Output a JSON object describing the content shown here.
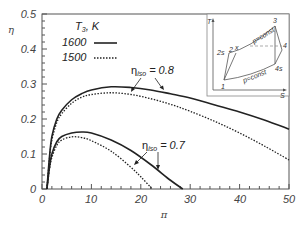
{
  "chart_data": {
    "type": "line",
    "title": "",
    "xlabel": "π",
    "ylabel": "η",
    "xlim": [
      0,
      50
    ],
    "ylim": [
      0,
      0.5
    ],
    "x_ticks": [
      "0",
      "10",
      "20",
      "30",
      "40",
      "50"
    ],
    "y_ticks": [
      "0",
      "0.1",
      "0.2",
      "0.3",
      "0.4",
      "0.5"
    ],
    "grid": false,
    "legend": {
      "title": "T3, K",
      "position": "upper-left",
      "entries": [
        {
          "label": "1600",
          "style": "solid"
        },
        {
          "label": "1500",
          "style": "dotted"
        }
      ]
    },
    "annotations": [
      {
        "text": "ηiso = 0.8",
        "target": "upper curve pair"
      },
      {
        "text": "ηiso = 0.7",
        "target": "lower curve pair"
      }
    ],
    "series": [
      {
        "name": "T3=1600 K, ηiso=0.8",
        "style": "solid",
        "x": [
          1,
          1.5,
          2,
          3,
          4,
          6,
          8,
          10,
          14,
          18,
          22,
          26,
          30,
          35,
          40,
          45,
          50
        ],
        "y": [
          0,
          0.09,
          0.15,
          0.2,
          0.225,
          0.255,
          0.272,
          0.283,
          0.292,
          0.29,
          0.283,
          0.272,
          0.26,
          0.24,
          0.22,
          0.197,
          0.171
        ]
      },
      {
        "name": "T3=1500 K, ηiso=0.8",
        "style": "dotted",
        "x": [
          1,
          1.5,
          2,
          3,
          4,
          6,
          8,
          10,
          14,
          18,
          22,
          26,
          30,
          35,
          40,
          45,
          50
        ],
        "y": [
          0,
          0.085,
          0.14,
          0.19,
          0.215,
          0.245,
          0.262,
          0.27,
          0.275,
          0.27,
          0.258,
          0.242,
          0.222,
          0.193,
          0.16,
          0.123,
          0.083
        ]
      },
      {
        "name": "T3=1600 K, ηiso=0.7",
        "style": "solid",
        "x": [
          1,
          1.5,
          2,
          3,
          4,
          6,
          8,
          10,
          14,
          18,
          22,
          26,
          28.5
        ],
        "y": [
          0,
          0.06,
          0.1,
          0.135,
          0.15,
          0.16,
          0.163,
          0.16,
          0.14,
          0.11,
          0.07,
          0.025,
          0
        ]
      },
      {
        "name": "T3=1500 K, ηiso=0.7",
        "style": "dotted",
        "x": [
          1,
          1.5,
          2,
          3,
          4,
          6,
          8,
          10,
          14,
          18,
          20,
          22.3
        ],
        "y": [
          0,
          0.055,
          0.09,
          0.125,
          0.14,
          0.149,
          0.147,
          0.138,
          0.108,
          0.062,
          0.035,
          0
        ]
      }
    ],
    "inset": {
      "type": "T-s diagram",
      "xlabel": "S",
      "ylabel": "T",
      "point_labels": [
        "1",
        "2s",
        "2",
        "x",
        "3",
        "4",
        "4s"
      ],
      "isobar_labels": [
        "p=const",
        "p=const"
      ]
    }
  },
  "labels": {
    "ylabel": "η",
    "xlabel": "π",
    "legend_title_main": "T",
    "legend_title_sub": "3",
    "legend_title_unit": ", K",
    "legend_1600": "1600",
    "legend_1500": "1500",
    "annot_08_eta": "η",
    "annot_08_sub": "iso",
    "annot_08_val": " = 0.8",
    "annot_07_eta": "η",
    "annot_07_sub": "iso",
    "annot_07_val": " = 0.7",
    "xt0": "0",
    "xt10": "10",
    "xt20": "20",
    "xt30": "30",
    "xt40": "40",
    "xt50": "50",
    "yt0": "0",
    "yt1": "0.1",
    "yt2": "0.2",
    "yt3": "0.3",
    "yt4": "0.4",
    "yt5": "0.5",
    "inset_T": "T",
    "inset_S": "S",
    "inset_1": "1",
    "inset_2s": "2s",
    "inset_2": "2",
    "inset_x": "x",
    "inset_3": "3",
    "inset_4": "4",
    "inset_4s": "4s",
    "inset_pconst_top": "p=const",
    "inset_pconst_bot": "p=const"
  }
}
